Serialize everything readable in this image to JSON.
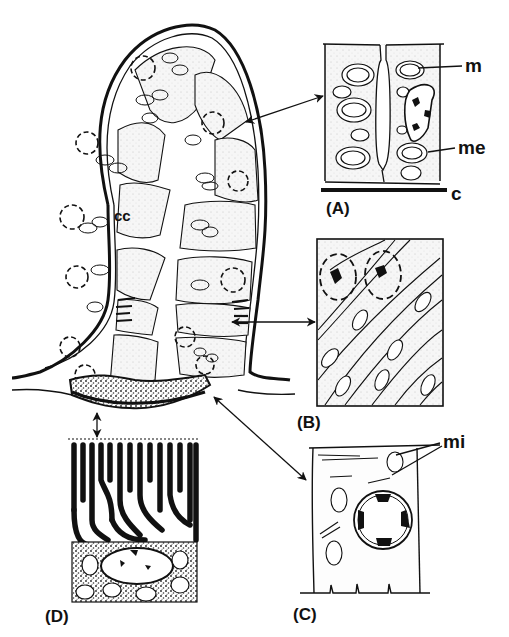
{
  "figure": {
    "central_label": "cc",
    "panels": [
      {
        "id": "A",
        "label": "(A)"
      },
      {
        "id": "B",
        "label": "(B)"
      },
      {
        "id": "C",
        "label": "(C)"
      },
      {
        "id": "D",
        "label": "(D)"
      }
    ],
    "annotations": {
      "m": "m",
      "me": "me",
      "c": "c",
      "mi": "mi"
    },
    "colors": {
      "ink": "#111111",
      "paper": "#ffffff",
      "stipple": "#f4f4f4"
    }
  }
}
